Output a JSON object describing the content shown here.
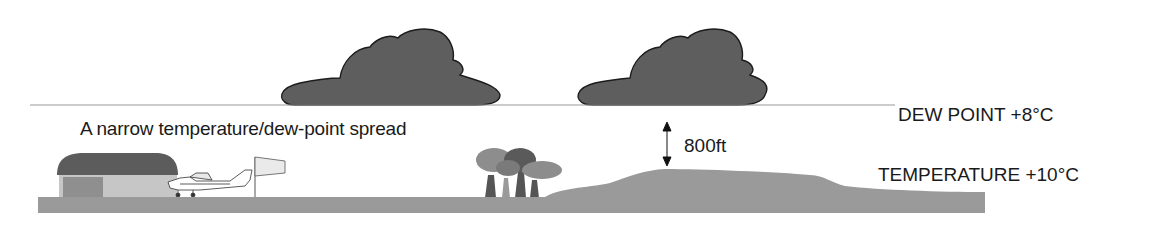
{
  "diagram": {
    "caption": "A narrow  temperature/dew-point spread",
    "dew_point_label": "DEW POINT +8°C",
    "temperature_label": "TEMPERATURE +10°C",
    "cloud_base_gap_label": "800ft",
    "elements": [
      "cloud",
      "cloud",
      "dew-point-line",
      "hangar",
      "light-aircraft",
      "windsock",
      "trees",
      "hill",
      "ground",
      "double-arrow"
    ],
    "colors": {
      "cloud_fill": "#5e5e5e",
      "cloud_outline": "#1c1c1c",
      "ground": "#9a9a9a",
      "hangar_roof": "#5c5c5c",
      "hangar_wall": "#c6c6c6",
      "hangar_door": "#8f8f8f",
      "dew_line": "#9a9a9a",
      "tree_dark": "#5a5a5a",
      "tree_light": "#8d8d8d"
    }
  }
}
